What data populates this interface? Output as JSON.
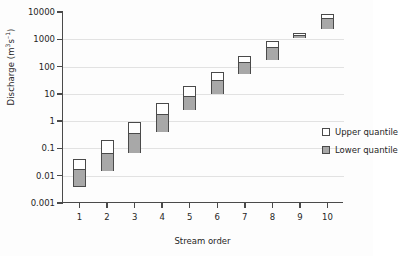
{
  "chart_data": {
    "type": "bar",
    "title": "",
    "subtitle": "",
    "xlabel": "Stream order",
    "ylabel": "Discharge (m3s-1)",
    "ylabel_html": "Discharge (m<sup>3</sup>s<sup>-1</sup>)",
    "categories": [
      "1",
      "2",
      "3",
      "4",
      "5",
      "6",
      "7",
      "8",
      "9",
      "10"
    ],
    "x": [
      1,
      2,
      3,
      4,
      5,
      6,
      7,
      8,
      9,
      10
    ],
    "xlim": [
      0.4,
      10.6
    ],
    "ylim": [
      0.001,
      10000
    ],
    "yscale": "log",
    "ytick_labels": [
      "0.001",
      "0.01",
      "0.1",
      "1",
      "10",
      "100",
      "1000",
      "10000"
    ],
    "ytick_values": [
      0.001,
      0.01,
      0.1,
      1,
      10,
      100,
      1000,
      10000
    ],
    "grid": "horizontal",
    "legend_position": "inside-right",
    "series": [
      {
        "name": "Upper quantile",
        "color": "#ffffff",
        "values": [
          0.04,
          0.2,
          0.95,
          4.5,
          20,
          65,
          250,
          850,
          1700,
          8500
        ]
      },
      {
        "name": "Lower quantile",
        "color": "#a8a8a8",
        "values": [
          0.004,
          0.015,
          0.07,
          0.4,
          2.5,
          10,
          55,
          170,
          1100,
          2400
        ]
      }
    ],
    "median_values": [
      0.017,
      0.07,
      0.35,
      1.8,
      8,
      32,
      140,
      500,
      1400,
      6000
    ],
    "bars": [
      {
        "order": 1,
        "low": 0.004,
        "median": 0.017,
        "high": 0.04
      },
      {
        "order": 2,
        "low": 0.015,
        "median": 0.07,
        "high": 0.2
      },
      {
        "order": 3,
        "low": 0.07,
        "median": 0.35,
        "high": 0.95
      },
      {
        "order": 4,
        "low": 0.4,
        "median": 1.8,
        "high": 4.5
      },
      {
        "order": 5,
        "low": 2.5,
        "median": 8,
        "high": 20
      },
      {
        "order": 6,
        "low": 10,
        "median": 32,
        "high": 65
      },
      {
        "order": 7,
        "low": 55,
        "median": 140,
        "high": 250
      },
      {
        "order": 8,
        "low": 170,
        "median": 500,
        "high": 850
      },
      {
        "order": 9,
        "low": 1100,
        "median": 1400,
        "high": 1700
      },
      {
        "order": 10,
        "low": 2400,
        "median": 6000,
        "high": 8500
      }
    ],
    "legend": [
      {
        "label": "Upper quantile",
        "swatch": "upper"
      },
      {
        "label": "Lower quantile",
        "swatch": "lower"
      }
    ],
    "colors": {
      "axis": "#4a4a4a",
      "grid": "#e2e2e2",
      "upper_fill": "#ffffff",
      "lower_fill": "#a8a8a8",
      "text": "#262626",
      "background": "#fdfdfd"
    }
  }
}
